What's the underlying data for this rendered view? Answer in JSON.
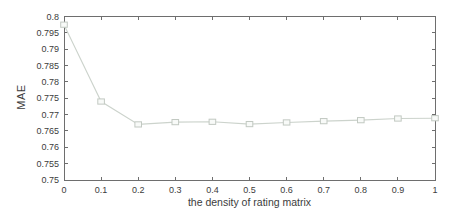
{
  "figure": {
    "background": "#ffffff",
    "axis_color": "#6e6e6e",
    "text_color": "#3c3c3c",
    "line_color": "#ccd3cc",
    "marker_edge_color": "#c2c9c2",
    "marker_fill_color": "#f8faf8"
  },
  "chart_data": {
    "type": "line",
    "title": "",
    "xlabel": "the density of rating matrix",
    "ylabel": "MAE",
    "x": [
      0,
      0.1,
      0.2,
      0.3,
      0.4,
      0.5,
      0.6,
      0.7,
      0.8,
      0.9,
      1
    ],
    "series": [
      {
        "name": "MAE",
        "marker": "square",
        "values": [
          0.7975,
          0.774,
          0.767,
          0.7677,
          0.7678,
          0.7671,
          0.7676,
          0.768,
          0.7683,
          0.7688,
          0.7689
        ]
      }
    ],
    "xlim": [
      0,
      1
    ],
    "ylim": [
      0.75,
      0.8
    ],
    "grid": false,
    "legend": null,
    "x_ticks": [
      0,
      0.1,
      0.2,
      0.3,
      0.4,
      0.5,
      0.6,
      0.7,
      0.8,
      0.9,
      1
    ],
    "x_tick_labels": [
      "0",
      "0.1",
      "0.2",
      "0.3",
      "0.4",
      "0.5",
      "0.6",
      "0.7",
      "0.8",
      "0.9",
      "1"
    ],
    "y_ticks": [
      0.75,
      0.755,
      0.76,
      0.765,
      0.77,
      0.775,
      0.78,
      0.785,
      0.79,
      0.795,
      0.8
    ],
    "y_tick_labels": [
      "0.75",
      "0.755",
      "0.76",
      "0.765",
      "0.77",
      "0.775",
      "0.78",
      "0.785",
      "0.79",
      "0.795",
      "0.8"
    ]
  }
}
